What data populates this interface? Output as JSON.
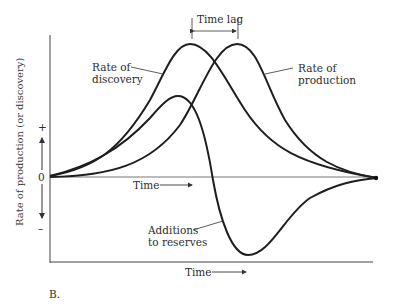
{
  "figure": {
    "panel_label": "B.",
    "y_axis_label": "Rate of production (or discovery)",
    "y_ticks": {
      "plus": "+",
      "zero": "0",
      "minus": "–"
    },
    "inner_time_label": "Time",
    "bottom_time_label": "Time",
    "time_lag_label": "Time lag",
    "curves": [
      {
        "name": "Rate of discovery",
        "label_line1": "Rate of",
        "label_line2": "discovery"
      },
      {
        "name": "Rate of production",
        "label_line1": "Rate of",
        "label_line2": "production"
      },
      {
        "name": "Additions to reserves",
        "label_line1": "Additions",
        "label_line2": "to reserves"
      }
    ],
    "colors": {
      "line": "#1e1e1e",
      "axis": "#444444",
      "background": "#ffffff"
    }
  }
}
